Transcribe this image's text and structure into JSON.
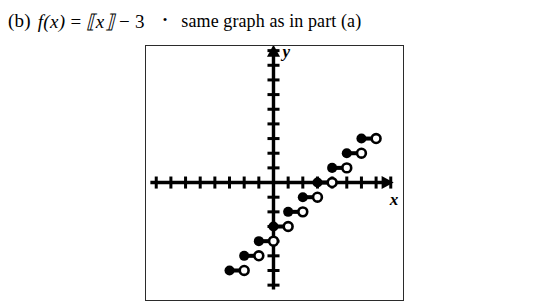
{
  "caption": {
    "part_label": "(b)",
    "formula_fx": "f(x)",
    "formula_equals": "=",
    "formula_floor": "⟦x⟧",
    "formula_minus": "−",
    "formula_constant": "3",
    "bullet": "•",
    "note": "same graph as in part (a)"
  },
  "graph": {
    "x_axis_label": "x",
    "y_axis_label": "y",
    "axis_color": "#000000",
    "frame_color": "#2b2b2b",
    "background": "#ffffff",
    "x_tick_count_left": 8,
    "x_tick_count_right": 8,
    "y_tick_count_up": 9,
    "y_tick_count_down": 7,
    "unit_px": 14.6,
    "origin_x_px": 127,
    "origin_y_px": 136
  },
  "chart_data": {
    "type": "line",
    "title": "",
    "subtitle": "",
    "xlabel": "x",
    "ylabel": "y",
    "function": "f(x) = floor(x) - 3",
    "grid": false,
    "legend": null,
    "xlim": [
      -8,
      8
    ],
    "ylim": [
      -7,
      9
    ],
    "xticks": [
      -8,
      -7,
      -6,
      -5,
      -4,
      -3,
      -2,
      -1,
      0,
      1,
      2,
      3,
      4,
      5,
      6,
      7,
      8
    ],
    "yticks": [
      -7,
      -6,
      -5,
      -4,
      -3,
      -2,
      -1,
      0,
      1,
      2,
      3,
      4,
      5,
      6,
      7,
      8,
      9
    ],
    "tick_labels_shown": false,
    "steps": [
      {
        "x_start": -3,
        "x_end": -2,
        "y": -6,
        "closed_left": true,
        "open_right": true
      },
      {
        "x_start": -2,
        "x_end": -1,
        "y": -5,
        "closed_left": true,
        "open_right": true
      },
      {
        "x_start": -1,
        "x_end": 0,
        "y": -4,
        "closed_left": true,
        "open_right": true
      },
      {
        "x_start": 0,
        "x_end": 1,
        "y": -3,
        "closed_left": true,
        "open_right": true
      },
      {
        "x_start": 1,
        "x_end": 2,
        "y": -2,
        "closed_left": true,
        "open_right": true
      },
      {
        "x_start": 2,
        "x_end": 3,
        "y": -1,
        "closed_left": true,
        "open_right": true
      },
      {
        "x_start": 3,
        "x_end": 4,
        "y": 0,
        "closed_left": true,
        "open_right": true
      },
      {
        "x_start": 4,
        "x_end": 5,
        "y": 1,
        "closed_left": true,
        "open_right": true
      },
      {
        "x_start": 5,
        "x_end": 6,
        "y": 2,
        "closed_left": true,
        "open_right": true
      },
      {
        "x_start": 6,
        "x_end": 7,
        "y": 3,
        "closed_left": true,
        "open_right": true
      }
    ],
    "marker_style": {
      "closed_fill": "#000000",
      "open_fill": "#ffffff",
      "open_stroke": "#000000",
      "radius_px": 5,
      "segment_width_px": 4
    }
  }
}
